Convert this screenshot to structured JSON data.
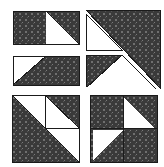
{
  "figure": {
    "width": 164,
    "height": 167,
    "background": "#ffffff",
    "fill_dark": "#3a3a3a",
    "fill_light": "#ffffff",
    "stroke": "#1a1a1a",
    "speckle": "#6f6f6f",
    "stroke_width": 1,
    "pattern_name": "dark-speckled-fill"
  },
  "blocks": [
    {
      "id": "block-top-left-upper",
      "name": "rectangle-two-units-dark-with-white-triangle-right",
      "x": 13,
      "y": 11,
      "w": 66,
      "h": 33,
      "units": "2x1",
      "shapes": [
        {
          "name": "dark-rectangle-left-unit",
          "type": "rect",
          "fill": "dark",
          "points": "13,11 46,11 46,44 13,44"
        },
        {
          "name": "dark-triangle-upper-right",
          "type": "triangle",
          "fill": "dark",
          "points": "46,11 79,11 79,44"
        },
        {
          "name": "white-triangle-lower-left-of-right-unit",
          "type": "triangle",
          "fill": "light",
          "points": "46,11 79,44 46,44"
        }
      ]
    },
    {
      "id": "block-top-left-lower",
      "name": "rectangle-two-units-white-triangle-upper-left",
      "x": 13,
      "y": 56,
      "w": 66,
      "h": 29,
      "units": "2x1",
      "shapes": [
        {
          "name": "white-triangle-upper-left",
          "type": "triangle",
          "fill": "light",
          "points": "13,56 46,56 13,85"
        },
        {
          "name": "dark-triangle-lower-left",
          "type": "triangle",
          "fill": "dark",
          "points": "13,85 46,56 46,85"
        },
        {
          "name": "dark-rectangle-right-unit",
          "type": "rect",
          "fill": "dark",
          "points": "46,56 79,56 79,85 46,85"
        }
      ]
    },
    {
      "id": "block-top-right",
      "name": "large-dark-triangle-with-nested-white-and-dark-triangles",
      "x": 86,
      "y": 10,
      "w": 74,
      "h": 78,
      "units": "2x2-diagonal",
      "shapes": [
        {
          "name": "large-dark-triangle-upper-right",
          "type": "triangle",
          "fill": "dark",
          "points": "86,10 160,10 160,88"
        },
        {
          "name": "white-outlined-triangle-top-left",
          "type": "triangle",
          "fill": "light",
          "points": "86,14 86,50 122,50"
        },
        {
          "name": "dark-triangle-middle-left",
          "type": "triangle",
          "fill": "dark",
          "points": "86,55 122,55 86,88"
        },
        {
          "name": "white-triangle-bottom-right-wedge",
          "type": "triangle",
          "fill": "light",
          "points": "122,55 160,88 122,88"
        }
      ]
    },
    {
      "id": "block-bottom-left",
      "name": "square-with-large-dark-triangle-and-quarter-dark-triangle",
      "x": 12,
      "y": 95,
      "w": 67,
      "h": 67,
      "units": "2x2",
      "shapes": [
        {
          "name": "large-dark-triangle-lower-left",
          "type": "triangle",
          "fill": "dark",
          "points": "12,95 79,162 12,162"
        },
        {
          "name": "white-triangle-upper-left-unit",
          "type": "triangle",
          "fill": "light",
          "points": "12,95 45,95 45,128"
        },
        {
          "name": "dark-triangle-upper-right-unit",
          "type": "triangle",
          "fill": "dark",
          "points": "45,95 79,95 79,128"
        },
        {
          "name": "white-triangle-lower-right-unit",
          "type": "triangle",
          "fill": "light",
          "points": "45,128 79,128 79,162"
        }
      ]
    },
    {
      "id": "block-bottom-right",
      "name": "dark-square-pinwheel-with-two-white-triangles",
      "x": 90,
      "y": 95,
      "w": 67,
      "h": 67,
      "units": "2x2",
      "shapes": [
        {
          "name": "dark-square-background",
          "type": "rect",
          "fill": "dark",
          "points": "90,95 157,95 157,162 90,162"
        },
        {
          "name": "white-triangle-upper-right-unit",
          "type": "triangle",
          "fill": "light",
          "points": "124,98 154,128 124,128"
        },
        {
          "name": "white-triangle-lower-left-unit",
          "type": "triangle",
          "fill": "light",
          "points": "93,130 123,130 93,160"
        }
      ]
    }
  ]
}
